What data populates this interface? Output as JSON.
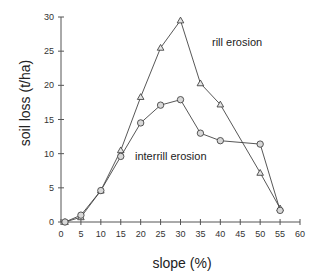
{
  "chart_data": {
    "type": "line",
    "title": "",
    "xlabel": "slope (%)",
    "ylabel": "soil loss (t/ha)",
    "xlim": [
      0,
      60
    ],
    "ylim": [
      0,
      30
    ],
    "xticks": [
      0,
      5,
      10,
      15,
      20,
      25,
      30,
      35,
      40,
      45,
      50,
      55,
      60
    ],
    "yticks": [
      0,
      5,
      10,
      15,
      20,
      25,
      30
    ],
    "grid": false,
    "legend": "inline labels",
    "series": [
      {
        "name": "rill erosion",
        "marker": "triangle",
        "x": [
          1,
          5,
          10,
          15,
          20,
          25,
          30,
          35,
          40,
          50,
          55
        ],
        "values": [
          0,
          0.7,
          4.6,
          10.5,
          18.3,
          25.5,
          29.5,
          20.3,
          17.2,
          7.2,
          2.0
        ]
      },
      {
        "name": "interrill erosion",
        "marker": "circle",
        "x": [
          1,
          5,
          10,
          15,
          20,
          25,
          30,
          35,
          40,
          50,
          55
        ],
        "values": [
          0,
          1.0,
          4.6,
          9.6,
          14.5,
          17.1,
          17.9,
          13.0,
          11.9,
          11.4,
          1.7
        ]
      }
    ],
    "annotations": [
      {
        "text": "rill erosion",
        "x": 40,
        "y": 27.5
      },
      {
        "text": "interrill erosion",
        "x": 18,
        "y": 9.6
      }
    ]
  }
}
